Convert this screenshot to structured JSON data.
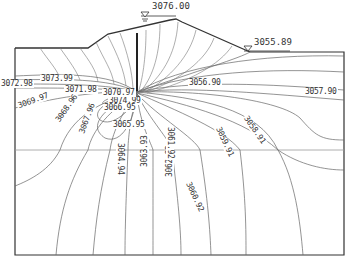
{
  "diagram": {
    "type": "seepage equipotential contour section",
    "water_levels": {
      "upstream": {
        "label": "3076.00",
        "icon": "water-level-triangle-icon"
      },
      "downstream": {
        "label": "3055.89",
        "icon": "water-level-triangle-icon"
      }
    },
    "contour_labels": [
      {
        "value": "3074.99",
        "x": 108,
        "y": 97,
        "rot": 0
      },
      {
        "value": "3073.99",
        "x": 40,
        "y": 75,
        "rot": 0
      },
      {
        "value": "3072.98",
        "x": 0,
        "y": 80,
        "rot": 0
      },
      {
        "value": "3071.98",
        "x": 64,
        "y": 86,
        "rot": 0
      },
      {
        "value": "3070.97",
        "x": 102,
        "y": 89,
        "rot": 0
      },
      {
        "value": "3069.97",
        "x": 16,
        "y": 103,
        "rot": -20
      },
      {
        "value": "3068.96",
        "x": 54,
        "y": 120,
        "rot": -55
      },
      {
        "value": "3067.96",
        "x": 78,
        "y": 133,
        "rot": -70
      },
      {
        "value": "3066.95",
        "x": 103,
        "y": 104,
        "rot": 0
      },
      {
        "value": "3065.95",
        "x": 112,
        "y": 121,
        "rot": 0
      },
      {
        "value": "3064.94",
        "x": 124,
        "y": 142,
        "rot": 90
      },
      {
        "value": "3063.93",
        "x": 141,
        "y": 168,
        "rot": -90
      },
      {
        "value": "3062.93",
        "x": 166,
        "y": 178,
        "rot": -90
      },
      {
        "value": "3061.92",
        "x": 174,
        "y": 126,
        "rot": 90
      },
      {
        "value": "3060.92",
        "x": 191,
        "y": 180,
        "rot": 65
      },
      {
        "value": "3059.91",
        "x": 221,
        "y": 125,
        "rot": 65
      },
      {
        "value": "3058.91",
        "x": 248,
        "y": 114,
        "rot": 55
      },
      {
        "value": "3057.90",
        "x": 304,
        "y": 88,
        "rot": 0
      },
      {
        "value": "3056.90",
        "x": 188,
        "y": 79,
        "rot": 0
      }
    ],
    "colors": {
      "line": "#555555",
      "boundary": "#333333",
      "wall": "#222222",
      "background": "#ffffff"
    }
  }
}
